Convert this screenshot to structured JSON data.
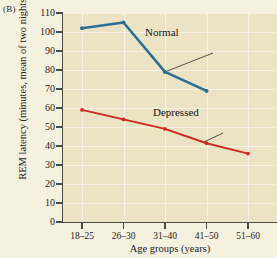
{
  "panel": {
    "letter": "(B)"
  },
  "chart_data": {
    "type": "line",
    "title": "",
    "xlabel": "Age groups (years)",
    "ylabel": "REM latency (minutes, mean of two nights)",
    "categories": [
      "18–25",
      "26–30",
      "31–40",
      "41–50",
      "51–60"
    ],
    "ylim": [
      0,
      110
    ],
    "yticks": [
      0,
      10,
      20,
      30,
      40,
      50,
      60,
      70,
      80,
      90,
      100,
      110
    ],
    "grid": true,
    "legend_position": "inline-annotations",
    "series": [
      {
        "name": "Normal",
        "color": "#2b6f96",
        "x": [
          "18–25",
          "26–30",
          "31–40",
          "41–50"
        ],
        "values": [
          102,
          105,
          79,
          69
        ]
      },
      {
        "name": "Depressed",
        "color": "#cc2a22",
        "x": [
          "18–25",
          "26–30",
          "31–40",
          "41–50",
          "51–60"
        ],
        "values": [
          59,
          54,
          49,
          41.5,
          36
        ]
      }
    ],
    "annotations": [
      {
        "text": "Normal",
        "target_series": "Normal",
        "target_point": "31–40"
      },
      {
        "text": "Depressed",
        "target_series": "Depressed",
        "target_point": "41–50"
      }
    ]
  },
  "colors": {
    "plot_background": "#ece2c4",
    "page_background": "#f6f1df",
    "axis": "#4a4a46",
    "gridline": "#ffffff",
    "normal_series": "#2b6f96",
    "depressed_series": "#cc2a22"
  }
}
